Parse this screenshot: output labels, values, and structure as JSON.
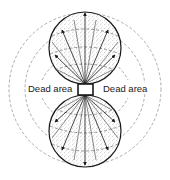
{
  "diagram": {
    "title": "",
    "labels": {
      "left": "Dead area",
      "right": "Dead area"
    },
    "colors": {
      "outline": "#1a1a1a",
      "stipple": "#9a9a9a",
      "dashed": "#8a8a8a",
      "background": "#ffffff"
    }
  }
}
